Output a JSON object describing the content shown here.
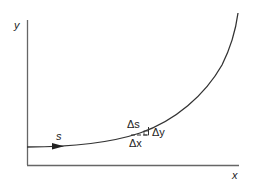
{
  "diagram": {
    "axes": {
      "y_label": "y",
      "x_label": "x"
    },
    "curve": {
      "label": "s",
      "direction_arrow": "arrow-right"
    },
    "triangle": {
      "hypotenuse_label": "Δs",
      "vertical_label": "Δy",
      "horizontal_label": "Δx"
    },
    "colors": {
      "line": "#333333",
      "axis": "#555555",
      "text": "#222222"
    }
  }
}
